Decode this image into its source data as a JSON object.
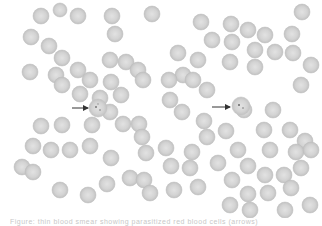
{
  "figure": {
    "type": "blood smear micrograph",
    "background_color": "#ffffff",
    "cell_fill": "#d2d2d2",
    "cell_edge": "#bdbdbd",
    "arrow_color": "#333333",
    "arrows": [
      {
        "from": [
          72,
          108
        ],
        "to": [
          88,
          108
        ],
        "target": "infected red blood cell (left)"
      },
      {
        "from": [
          212,
          107
        ],
        "to": [
          230,
          107
        ],
        "target": "infected red blood cell (right)"
      }
    ],
    "cells": [
      [
        41,
        16,
        8
      ],
      [
        60,
        10,
        7
      ],
      [
        78,
        16,
        8
      ],
      [
        112,
        16,
        8
      ],
      [
        152,
        14,
        8
      ],
      [
        31,
        37,
        8
      ],
      [
        49,
        46,
        8
      ],
      [
        30,
        72,
        8
      ],
      [
        56,
        75,
        8
      ],
      [
        45,
        68,
        0
      ],
      [
        62,
        58,
        8
      ],
      [
        78,
        70,
        8
      ],
      [
        90,
        80,
        8
      ],
      [
        62,
        85,
        8
      ],
      [
        80,
        94,
        8
      ],
      [
        110,
        60,
        8
      ],
      [
        115,
        34,
        8
      ],
      [
        126,
        62,
        8
      ],
      [
        138,
        70,
        8
      ],
      [
        143,
        80,
        8
      ],
      [
        100,
        98,
        8
      ],
      [
        121,
        95,
        8
      ],
      [
        111,
        82,
        8
      ],
      [
        201,
        22,
        8
      ],
      [
        231,
        24,
        8
      ],
      [
        248,
        30,
        8
      ],
      [
        265,
        35,
        8
      ],
      [
        292,
        34,
        8
      ],
      [
        212,
        40,
        8
      ],
      [
        232,
        42,
        8
      ],
      [
        255,
        50,
        8
      ],
      [
        275,
        52,
        8
      ],
      [
        293,
        53,
        8
      ],
      [
        178,
        53,
        8
      ],
      [
        198,
        60,
        8
      ],
      [
        230,
        62,
        8
      ],
      [
        255,
        67,
        8
      ],
      [
        183,
        75,
        8
      ],
      [
        193,
        80,
        8
      ],
      [
        207,
        90,
        8
      ],
      [
        169,
        80,
        8
      ],
      [
        301,
        85,
        8
      ],
      [
        170,
        100,
        8
      ],
      [
        302,
        12,
        8
      ],
      [
        311,
        65,
        8
      ],
      [
        41,
        126,
        8
      ],
      [
        62,
        125,
        8
      ],
      [
        92,
        125,
        8
      ],
      [
        110,
        112,
        8
      ],
      [
        123,
        124,
        8
      ],
      [
        139,
        124,
        8
      ],
      [
        142,
        137,
        8
      ],
      [
        33,
        146,
        8
      ],
      [
        51,
        150,
        8
      ],
      [
        70,
        150,
        8
      ],
      [
        90,
        146,
        8
      ],
      [
        111,
        158,
        8
      ],
      [
        146,
        153,
        8
      ],
      [
        22,
        167,
        8
      ],
      [
        33,
        172,
        8
      ],
      [
        60,
        190,
        8
      ],
      [
        88,
        195,
        8
      ],
      [
        107,
        184,
        8
      ],
      [
        130,
        178,
        8
      ],
      [
        144,
        180,
        8
      ],
      [
        150,
        193,
        8
      ],
      [
        182,
        112,
        8
      ],
      [
        244,
        110,
        8
      ],
      [
        273,
        110,
        8
      ],
      [
        204,
        121,
        8
      ],
      [
        226,
        131,
        8
      ],
      [
        264,
        130,
        8
      ],
      [
        290,
        130,
        8
      ],
      [
        305,
        141,
        8
      ],
      [
        166,
        148,
        8
      ],
      [
        192,
        152,
        8
      ],
      [
        207,
        137,
        8
      ],
      [
        238,
        150,
        8
      ],
      [
        270,
        150,
        8
      ],
      [
        296,
        152,
        8
      ],
      [
        311,
        150,
        8
      ],
      [
        171,
        166,
        8
      ],
      [
        190,
        168,
        8
      ],
      [
        218,
        163,
        8
      ],
      [
        248,
        166,
        8
      ],
      [
        265,
        175,
        8
      ],
      [
        284,
        175,
        8
      ],
      [
        301,
        168,
        8
      ],
      [
        198,
        187,
        8
      ],
      [
        232,
        180,
        8
      ],
      [
        248,
        194,
        8
      ],
      [
        268,
        193,
        8
      ],
      [
        291,
        188,
        8
      ],
      [
        310,
        205,
        8
      ],
      [
        174,
        190,
        8
      ],
      [
        230,
        205,
        8
      ],
      [
        250,
        210,
        8
      ],
      [
        285,
        210,
        8
      ]
    ]
  },
  "caption": {
    "text": "Figure: thin blood smear showing parasitized red blood cells (arrows)"
  }
}
